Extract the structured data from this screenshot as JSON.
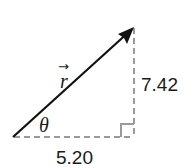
{
  "diagram": {
    "type": "right-triangle-vector",
    "vector": {
      "symbol": "r",
      "arrow_accent": "→",
      "color": "#111111"
    },
    "angle": {
      "symbol": "θ"
    },
    "horizontal_component": {
      "value": "5.20"
    },
    "vertical_component": {
      "value": "7.42"
    },
    "dashed_color": "#9a9a9a",
    "right_angle_marker": true
  }
}
